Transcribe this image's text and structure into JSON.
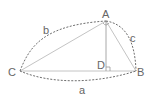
{
  "diagram": {
    "type": "triangle-with-altitude",
    "colors": {
      "solid_line": "#bdbdbd",
      "dashed_line": "#666666",
      "label": "#666666",
      "altitude": "#9a9a9a"
    },
    "vertices": [
      {
        "name": "A",
        "x": 106,
        "y": 21
      },
      {
        "name": "B",
        "x": 136,
        "y": 71
      },
      {
        "name": "C",
        "x": 20,
        "y": 71
      },
      {
        "name": "D",
        "x": 106,
        "y": 71
      }
    ],
    "labels": {
      "A": "A",
      "B": "B",
      "C": "C",
      "D": "D",
      "side_a": "a",
      "side_b": "b",
      "side_c": "c"
    },
    "edges": [
      {
        "from": "C",
        "to": "A",
        "style": "solid"
      },
      {
        "from": "A",
        "to": "B",
        "style": "solid"
      },
      {
        "from": "C",
        "to": "B",
        "style": "solid"
      },
      {
        "from": "A",
        "to": "D",
        "style": "solid",
        "role": "altitude"
      }
    ],
    "arcs": [
      {
        "side": "b",
        "from": "C",
        "to": "A",
        "style": "dashed"
      },
      {
        "side": "c",
        "from": "A",
        "to": "B",
        "style": "dashed"
      },
      {
        "side": "a",
        "from": "C",
        "to": "B",
        "style": "dashed"
      }
    ],
    "markers": [
      {
        "type": "right-angle",
        "at": "D"
      },
      {
        "type": "angle-arc",
        "at": "A"
      }
    ]
  }
}
